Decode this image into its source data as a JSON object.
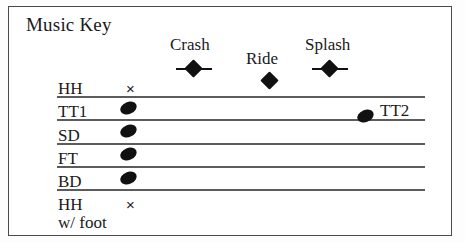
{
  "figure": {
    "title": "Music Key",
    "border_color": "#4a4a4a",
    "background": "#ffffff",
    "ink_color": "#111111"
  },
  "staff": {
    "line_count": 5,
    "line_color": "#5c5c5c",
    "left_x": 57,
    "right_x": 425,
    "line_y": [
      96,
      119,
      143,
      166,
      189
    ]
  },
  "rows": [
    {
      "label": "HH",
      "symbol": "x-marker",
      "symbol_glyph": "×",
      "label_x": 58,
      "label_y": 80,
      "symbol_x": 126,
      "symbol_y": 81
    },
    {
      "label": "TT1",
      "symbol": "note-oval",
      "symbol_glyph": "",
      "label_x": 58,
      "label_y": 103,
      "symbol_x": 120,
      "symbol_y": 102
    },
    {
      "label": "SD",
      "symbol": "note-oval",
      "symbol_glyph": "",
      "label_x": 58,
      "label_y": 127,
      "symbol_x": 120,
      "symbol_y": 125
    },
    {
      "label": "FT",
      "symbol": "note-oval",
      "symbol_glyph": "",
      "label_x": 58,
      "label_y": 150,
      "symbol_x": 120,
      "symbol_y": 148
    },
    {
      "label": "BD",
      "symbol": "note-oval",
      "symbol_glyph": "",
      "label_x": 58,
      "label_y": 173,
      "symbol_x": 120,
      "symbol_y": 172
    },
    {
      "label": "HH",
      "symbol": "x-marker",
      "symbol_glyph": "×",
      "label_x": 58,
      "label_y": 196,
      "symbol_x": 126,
      "symbol_y": 197
    }
  ],
  "sub_label": {
    "text": "w/ foot",
    "x": 58,
    "y": 214
  },
  "cymbals": [
    {
      "name": "Crash",
      "marker": "diamond-with-line",
      "label_x": 170,
      "label_y": 36,
      "marker_x": 176,
      "marker_y": 60
    },
    {
      "name": "Ride",
      "marker": "diamond",
      "label_x": 246,
      "label_y": 50,
      "marker_x": 252,
      "marker_y": 72
    },
    {
      "name": "Splash",
      "marker": "diamond-with-line",
      "label_x": 305,
      "label_y": 36,
      "marker_x": 312,
      "marker_y": 60
    }
  ],
  "staff_notes": [
    {
      "name": "TT2",
      "symbol": "note-oval",
      "symbol_x": 357,
      "symbol_y": 110,
      "label": "TT2",
      "label_x": 380,
      "label_y": 102
    }
  ]
}
